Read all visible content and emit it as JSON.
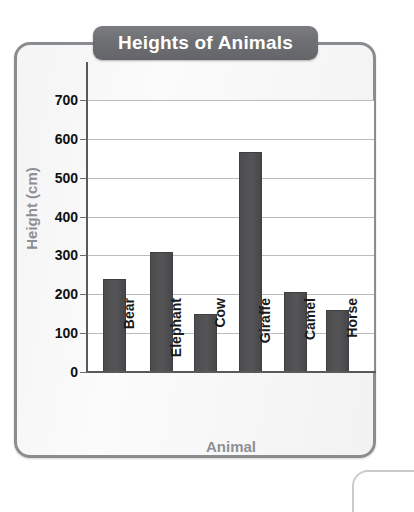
{
  "chart_data": {
    "type": "bar",
    "title": "Heights of Animals",
    "xlabel": "Animal",
    "ylabel": "Height (cm)",
    "categories": [
      "Bear",
      "Elephant",
      "Cow",
      "Giraffe",
      "Camel",
      "Horse"
    ],
    "values": [
      240,
      310,
      150,
      565,
      205,
      160
    ],
    "ylim": [
      0,
      700
    ],
    "ytick_step": 100,
    "yticks": [
      "700",
      "600",
      "500",
      "400",
      "300",
      "200",
      "100",
      "0"
    ],
    "ytick_values": [
      700,
      600,
      500,
      400,
      300,
      200,
      100,
      0
    ],
    "grid": true,
    "legend": false,
    "bar_color": "#4d4d4f",
    "title_banner_color": "#6d6f72",
    "axis_label_color": "#8d9094",
    "gridline_color": "#b9bcbe"
  }
}
